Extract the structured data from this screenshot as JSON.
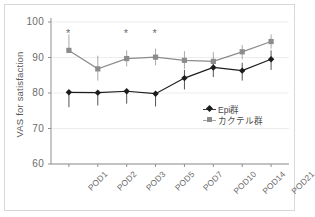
{
  "chart_data": {
    "type": "line",
    "title": "",
    "xlabel": "",
    "ylabel": "VAS for satisfaction",
    "ylim": [
      60,
      100
    ],
    "yticks": [
      60,
      70,
      80,
      90,
      100
    ],
    "grid": "horizontal-faint",
    "legend_position": "inside-right-lower",
    "categories": [
      "POD1",
      "POD2",
      "POD3",
      "POD5",
      "POD7",
      "POD10",
      "POD14",
      "POD21"
    ],
    "series": [
      {
        "name": "Epi群",
        "marker": "diamond",
        "color": "#1c1c1c",
        "values": [
          80.2,
          80.1,
          80.5,
          79.8,
          84.2,
          87.2,
          86.3,
          89.5
        ],
        "err_low": [
          76.0,
          76.5,
          77.0,
          76.2,
          81.0,
          84.5,
          83.5,
          86.5
        ],
        "err_high": [
          80.2,
          80.1,
          80.5,
          79.8,
          86.5,
          89.5,
          88.5,
          92.0
        ]
      },
      {
        "name": "カクテル群",
        "marker": "square",
        "color": "#8c8c8c",
        "values": [
          92.0,
          86.8,
          89.7,
          90.1,
          89.2,
          88.9,
          91.6,
          94.5
        ],
        "err_low": [
          92.0,
          83.5,
          87.5,
          87.8,
          86.8,
          86.5,
          89.5,
          92.5
        ],
        "err_high": [
          96.5,
          90.5,
          92.0,
          92.5,
          91.8,
          91.5,
          93.5,
          96.5
        ]
      }
    ],
    "annotations": [
      {
        "label": "*",
        "category": "POD1",
        "y": 97.0
      },
      {
        "label": "*",
        "category": "POD3",
        "y": 97.0
      },
      {
        "label": "*",
        "category": "POD5",
        "y": 97.0
      }
    ]
  },
  "colors": {
    "axis": "#8f8f8f",
    "grid": "#ededed",
    "epi": "#1c1c1c",
    "cocktail": "#8c8c8c",
    "tick_text": "#6b6b6b",
    "frame_border": "#d8d8d8"
  }
}
